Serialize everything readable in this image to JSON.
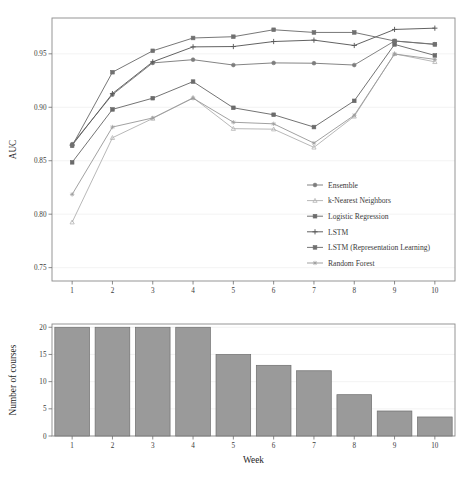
{
  "figure": {
    "background": "#ffffff",
    "bar_color": "#9a9a9a",
    "frame_color": "#8a8a8a",
    "grid_color": "#f0f0f0"
  },
  "chart_data": [
    {
      "type": "line",
      "title": "",
      "xlabel": "Week",
      "ylabel": "AUC",
      "x": [
        1,
        2,
        3,
        4,
        5,
        6,
        7,
        8,
        9,
        10
      ],
      "xtick_labels": [
        "1",
        "2",
        "3",
        "4",
        "5",
        "6",
        "7",
        "8",
        "9",
        "10"
      ],
      "ytick_labels": [
        "0.75",
        "0.80",
        "0.85",
        "0.90",
        "0.95"
      ],
      "ytick_values": [
        0.75,
        0.8,
        0.85,
        0.9,
        0.95
      ],
      "xlim": [
        0.5,
        10.5
      ],
      "ylim": [
        0.7375,
        0.9835
      ],
      "grid": true,
      "legend_position": "inside-lower-right",
      "series": [
        {
          "name": "Ensemble",
          "marker": "circle",
          "color": "#7d7d7d",
          "values": [
            0.8655,
            0.9118,
            0.9415,
            0.9445,
            0.9395,
            0.9415,
            0.9412,
            0.9395,
            0.962,
            0.959
          ]
        },
        {
          "name": "k-Nearest Neighbors",
          "marker": "triangle",
          "color": "#b4b4b4",
          "values": [
            0.7925,
            0.8715,
            0.8895,
            0.909,
            0.88,
            0.8795,
            0.8625,
            0.8915,
            0.95,
            0.9425
          ]
        },
        {
          "name": "Logistic Regression",
          "marker": "square",
          "color": "#6b6b6b",
          "values": [
            0.8485,
            0.898,
            0.9085,
            0.924,
            0.8995,
            0.893,
            0.8815,
            0.906,
            0.9588,
            0.9485
          ]
        },
        {
          "name": "LSTM",
          "marker": "plus",
          "color": "#5a5a5a",
          "values": [
            0.8645,
            0.9128,
            0.9425,
            0.9565,
            0.9568,
            0.9615,
            0.9628,
            0.9578,
            0.9728,
            0.974
          ]
        },
        {
          "name": "LSTM (Representation Learning)",
          "marker": "square-filled",
          "color": "#707070",
          "values": [
            0.864,
            0.9328,
            0.9528,
            0.9648,
            0.966,
            0.9725,
            0.97,
            0.97,
            0.962,
            0.9588
          ]
        },
        {
          "name": "Random Forest",
          "marker": "star",
          "color": "#9c9c9c",
          "values": [
            0.8185,
            0.8815,
            0.89,
            0.9085,
            0.886,
            0.8845,
            0.8665,
            0.8925,
            0.9498,
            0.9448
          ]
        }
      ]
    },
    {
      "type": "bar",
      "title": "",
      "xlabel": "Week",
      "ylabel": "Number of courses",
      "categories": [
        "1",
        "2",
        "3",
        "4",
        "5",
        "6",
        "7",
        "8",
        "9",
        "10"
      ],
      "values": [
        20,
        20,
        20,
        20,
        15,
        13,
        12,
        7.6,
        4.6,
        3.5
      ],
      "ytick_labels": [
        "0",
        "5",
        "10",
        "15",
        "20"
      ],
      "ytick_values": [
        0,
        5,
        10,
        15,
        20
      ],
      "ylim": [
        0,
        20.6
      ],
      "grid": true,
      "bar_color": "#9a9a9a"
    }
  ]
}
